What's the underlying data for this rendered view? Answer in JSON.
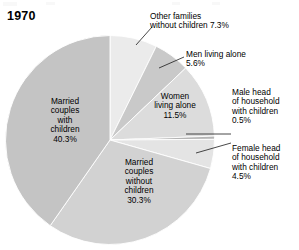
{
  "chart_data": {
    "type": "pie",
    "title": "1970",
    "subtitle": "",
    "xlabel": "",
    "ylabel": "",
    "legend_position": "none",
    "grid": false,
    "units": "percent",
    "categories": [
      "Other families without children",
      "Men living alone",
      "Women living alone",
      "Male head of household with children",
      "Female head of household with children",
      "Married couples without children",
      "Married couples with children"
    ],
    "values": [
      7.3,
      5.6,
      11.5,
      0.5,
      4.5,
      30.3,
      40.3
    ],
    "start_angle_deg": 0,
    "direction": "clockwise",
    "slices": [
      {
        "name": "Other families without children",
        "value": 7.3,
        "value_label": "7.3%",
        "label_text": "Other families\nwithout children 7.3%",
        "label_placement": "outside",
        "color": "#ebebeb",
        "start_deg": 0.0,
        "end_deg": 26.28
      },
      {
        "name": "Men living alone",
        "value": 5.6,
        "value_label": "5.6%",
        "label_text": "Men living alone\n5.6%",
        "label_placement": "outside",
        "color": "#c9c9c9",
        "start_deg": 26.28,
        "end_deg": 46.44
      },
      {
        "name": "Women living alone",
        "value": 11.5,
        "value_label": "11.5%",
        "label_text": "Women\nliving alone\n11.5%",
        "label_placement": "inside",
        "color": "#dcdcdc",
        "start_deg": 46.44,
        "end_deg": 87.84
      },
      {
        "name": "Male head of household with children",
        "value": 0.5,
        "value_label": "0.5%",
        "label_text": "Male head\nof household\nwith children\n0.5%",
        "label_placement": "outside",
        "color": "#b4b4b4",
        "start_deg": 87.84,
        "end_deg": 89.64
      },
      {
        "name": "Female head of household with children",
        "value": 4.5,
        "value_label": "4.5%",
        "label_text": "Female head\nof household\nwith children\n4.5%",
        "label_placement": "outside",
        "color": "#e4e4e4",
        "start_deg": 89.64,
        "end_deg": 105.84
      },
      {
        "name": "Married couples without children",
        "value": 30.3,
        "value_label": "30.3%",
        "label_text": "Married\ncouples\nwithout\nchildren\n30.3%",
        "label_placement": "inside",
        "color": "#d2d2d2",
        "start_deg": 105.84,
        "end_deg": 214.92
      },
      {
        "name": "Married couples with children",
        "value": 40.3,
        "value_label": "40.3%",
        "label_text": "Married\ncouples\nwith\nchildren\n40.3%",
        "label_placement": "inside",
        "color": "#c4c4c4",
        "start_deg": 214.92,
        "end_deg": 360.0
      }
    ]
  },
  "labels": {
    "other_families": "Other families\nwithout children 7.3%",
    "men_living_alone": "Men living alone\n5.6%",
    "male_head": "Male head\nof household\nwith children\n0.5%",
    "female_head": "Female head\nof household\nwith children\n4.5%",
    "women_living_alone": "Women\nliving alone\n11.5%",
    "married_with": "Married\ncouples\nwith\nchildren\n40.3%",
    "married_without": "Married\ncouples\nwithout\nchildren\n30.3%"
  },
  "colors": {
    "background": "#ffffff",
    "text": "#000000",
    "leader_line": "#1a1a1a",
    "slice_other": "#ebebeb",
    "slice_men": "#c9c9c9",
    "slice_women": "#dcdcdc",
    "slice_male_head": "#b4b4b4",
    "slice_female_head": "#e4e4e4",
    "slice_married_without": "#d2d2d2",
    "slice_married_with": "#c4c4c4"
  }
}
